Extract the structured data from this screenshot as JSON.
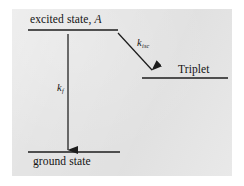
{
  "figure": {
    "name": "photochemical-energy-level-diagram",
    "background_color": "#ffffff",
    "panel_color": "#e4e4e4",
    "ink_color": "#1c1c1c"
  },
  "levels": {
    "excited": {
      "label_text": "excited state,",
      "label_species": "A",
      "line": {
        "x1": 28,
        "x2": 118,
        "y": 30
      }
    },
    "ground": {
      "label_text": "ground state",
      "line": {
        "x1": 28,
        "x2": 120,
        "y": 152
      }
    },
    "triplet": {
      "label_text": "Triplet",
      "line": {
        "x1": 142,
        "x2": 228,
        "y": 78
      }
    }
  },
  "transitions": {
    "fluorescence": {
      "symbol": "k",
      "subscript": "f",
      "from_level": "excited",
      "to_level": "ground",
      "arrow": {
        "x1": 68,
        "y1": 34,
        "x2": 68,
        "y2": 150
      }
    },
    "intersystem_crossing": {
      "symbol": "k",
      "subscript": "isc",
      "from_level": "excited",
      "to_level": "triplet",
      "arrow": {
        "x1": 118,
        "y1": 33,
        "x2": 152,
        "y2": 70
      }
    }
  }
}
